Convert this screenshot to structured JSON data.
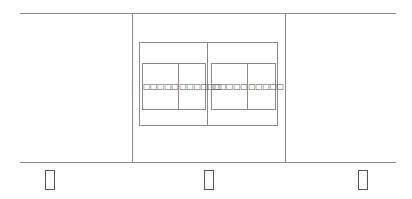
{
  "diagram": {
    "columns": [
      {
        "label": "□"
      },
      {
        "label": "□"
      },
      {
        "label": "□"
      }
    ],
    "outer_box": {
      "left_group": {
        "cells": [
          {
            "label": "□□□□□",
            "char_count": 5
          },
          {
            "label": "□□□□□□",
            "char_count": 6
          }
        ]
      },
      "right_group": {
        "cells": [
          {
            "label": "□□□□□",
            "char_count": 5
          },
          {
            "label": "□□□□□",
            "char_count": 5
          }
        ]
      }
    }
  },
  "colors": {
    "line": "#8a8a8a",
    "text": "#555555",
    "background": "#ffffff"
  }
}
